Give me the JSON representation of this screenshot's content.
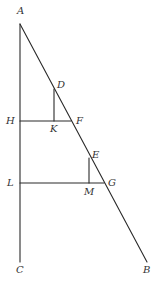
{
  "diagram": {
    "type": "geometric-figure",
    "points": {
      "A": {
        "label": "A",
        "x": 20,
        "y": 24
      },
      "B": {
        "label": "B",
        "x": 147,
        "y": 262
      },
      "C": {
        "label": "C",
        "x": 20,
        "y": 262
      },
      "D": {
        "label": "D",
        "x": 54,
        "y": 89
      },
      "E": {
        "label": "E",
        "x": 89,
        "y": 158
      },
      "F": {
        "label": "F",
        "x": 71,
        "y": 121
      },
      "G": {
        "label": "G",
        "x": 104,
        "y": 183
      },
      "H": {
        "label": "H",
        "x": 20,
        "y": 121
      },
      "K": {
        "label": "K",
        "x": 54,
        "y": 121
      },
      "L": {
        "label": "L",
        "x": 20,
        "y": 183
      },
      "M": {
        "label": "M",
        "x": 89,
        "y": 183
      }
    },
    "segments": [
      {
        "name": "AC",
        "from": "A",
        "to": "C"
      },
      {
        "name": "AB",
        "from": "A",
        "to": "B"
      },
      {
        "name": "HF",
        "from": "H",
        "to": "F"
      },
      {
        "name": "LG",
        "from": "L",
        "to": "G"
      },
      {
        "name": "DK",
        "from": "D",
        "to": "K"
      },
      {
        "name": "EM",
        "from": "E",
        "to": "M"
      }
    ],
    "labels": {
      "A": "A",
      "B": "B",
      "C": "C",
      "D": "D",
      "E": "E",
      "F": "F",
      "G": "G",
      "H": "H",
      "K": "K",
      "L": "L",
      "M": "M"
    },
    "colors": {
      "line": "#2a2a2a",
      "text": "#333333",
      "background": "#ffffff"
    }
  }
}
